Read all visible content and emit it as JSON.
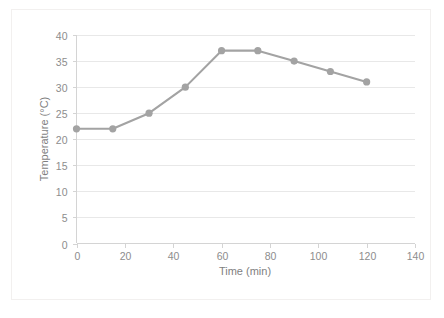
{
  "chart_data": {
    "type": "line",
    "title": "",
    "subtitle": "",
    "xlabel": "Time (min)",
    "ylabel": "Temperature (°C)",
    "x": [
      0,
      15,
      30,
      45,
      60,
      75,
      90,
      105,
      120
    ],
    "values": [
      22,
      22,
      25,
      30,
      37,
      37,
      35,
      33,
      31
    ],
    "series": [
      {
        "name": "Temperature",
        "x": [
          0,
          15,
          30,
          45,
          60,
          75,
          90,
          105,
          120
        ],
        "values": [
          22,
          22,
          25,
          30,
          37,
          37,
          35,
          33,
          31
        ],
        "color": "#a3a3a3",
        "marker": "circle"
      }
    ],
    "xlim": [
      0,
      140
    ],
    "ylim": [
      0,
      40
    ],
    "xticks": [
      0,
      20,
      40,
      60,
      80,
      100,
      120,
      140
    ],
    "yticks": [
      0,
      5,
      10,
      15,
      20,
      25,
      30,
      35,
      40
    ],
    "xtick_labels": [
      "0",
      "20",
      "40",
      "60",
      "80",
      "100",
      "120",
      "140"
    ],
    "ytick_labels": [
      "0",
      "5",
      "10",
      "15",
      "20",
      "25",
      "30",
      "35",
      "40"
    ],
    "grid": "horizontal",
    "grid_color": "#e8e8e8",
    "legend": "none",
    "legend_position": "none",
    "annotations": [],
    "plot_border_color": "#f2f0ef",
    "axis_color": "#d4d4d4",
    "tick_label_color": "#8d8d8d",
    "axis_title_color": "#7f7f7f",
    "background": "#ffffff"
  }
}
